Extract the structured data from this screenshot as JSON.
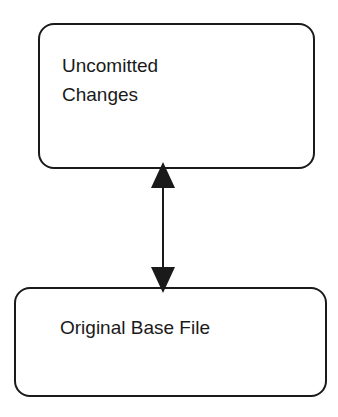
{
  "diagram": {
    "nodes": [
      {
        "id": "uncommitted",
        "label_line1": "Uncomitted",
        "label_line2": "Changes"
      },
      {
        "id": "base",
        "label": "Original Base File"
      }
    ],
    "edges": [
      {
        "from": "uncommitted",
        "to": "base",
        "type": "bidirectional-arrow"
      }
    ],
    "colors": {
      "stroke": "#1a1a1a",
      "background": "#ffffff"
    }
  }
}
